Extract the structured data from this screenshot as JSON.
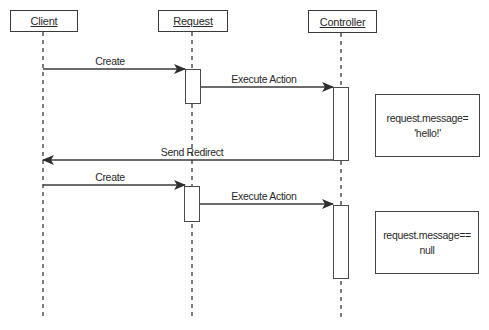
{
  "diagram": {
    "type": "sequence",
    "participants": [
      {
        "id": "client",
        "label": "Client"
      },
      {
        "id": "request",
        "label": "Request"
      },
      {
        "id": "controller",
        "label": "Controller"
      }
    ],
    "messages": [
      {
        "from": "client",
        "to": "request",
        "label": "Create"
      },
      {
        "from": "request",
        "to": "controller",
        "label": "Execute Action"
      },
      {
        "from": "controller",
        "to": "client",
        "label": "Send Redirect"
      },
      {
        "from": "client",
        "to": "request",
        "label": "Create"
      },
      {
        "from": "request",
        "to": "controller",
        "label": "Execute Action"
      }
    ],
    "notes": [
      {
        "line1": "request.message=",
        "line2": "'hello!'"
      },
      {
        "line1": "request.message==",
        "line2": "null"
      }
    ]
  },
  "colors": {
    "line": "#3a3a3a",
    "background": "#ffffff"
  }
}
